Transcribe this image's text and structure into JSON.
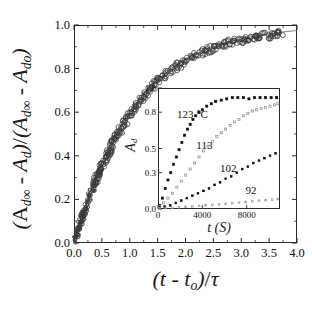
{
  "figure": {
    "background": "#ffffff",
    "ink": "#1a1a1a"
  },
  "chart_data": [
    {
      "id": "main",
      "type": "scatter",
      "title": "",
      "xlabel": "(t - to)/τ",
      "ylabel": "(Ad∞ - Ad)/(Ad∞ - Ado)",
      "xlim": [
        0.0,
        4.0
      ],
      "ylim": [
        0.0,
        1.0
      ],
      "xticks": [
        "0.0",
        "0.5",
        "1.0",
        "1.5",
        "2.0",
        "2.5",
        "3.0",
        "3.5",
        "4.0"
      ],
      "xtick_values": [
        0.0,
        0.5,
        1.0,
        1.5,
        2.0,
        2.5,
        3.0,
        3.5,
        4.0
      ],
      "yticks": [
        "0.0",
        "0.2",
        "0.4",
        "0.6",
        "0.8",
        "1.0"
      ],
      "ytick_values": [
        0.0,
        0.2,
        0.4,
        0.6,
        0.8,
        1.0
      ],
      "grid": false,
      "legend": "none",
      "marker": "open-circle",
      "marker_color": "#333333",
      "fit_line": {
        "present": true,
        "style": "solid-thin",
        "color": "#555555",
        "description": "master curve 1-exp(-x) style saturating fit"
      },
      "series": [
        {
          "name": "master curve (all temperatures collapsed)",
          "x": [
            0.02,
            0.04,
            0.05,
            0.06,
            0.07,
            0.08,
            0.09,
            0.1,
            0.11,
            0.12,
            0.13,
            0.14,
            0.15,
            0.16,
            0.17,
            0.18,
            0.19,
            0.2,
            0.22,
            0.24,
            0.26,
            0.28,
            0.3,
            0.32,
            0.34,
            0.36,
            0.38,
            0.4,
            0.42,
            0.44,
            0.46,
            0.48,
            0.5,
            0.53,
            0.56,
            0.59,
            0.62,
            0.65,
            0.68,
            0.71,
            0.74,
            0.77,
            0.8,
            0.84,
            0.88,
            0.92,
            0.96,
            1.0,
            1.05,
            1.1,
            1.15,
            1.2,
            1.25,
            1.3,
            1.36,
            1.42,
            1.48,
            1.54,
            1.6,
            1.67,
            1.74,
            1.81,
            1.88,
            1.95,
            2.02,
            2.1,
            2.18,
            2.26,
            2.34,
            2.42,
            2.5,
            2.58,
            2.66,
            2.74,
            2.82,
            2.9,
            2.98,
            3.06,
            3.14,
            3.22,
            3.3,
            3.38,
            3.46,
            3.54,
            3.62,
            3.7
          ],
          "y": [
            0.015,
            0.03,
            0.04,
            0.05,
            0.058,
            0.066,
            0.074,
            0.082,
            0.09,
            0.098,
            0.106,
            0.113,
            0.121,
            0.128,
            0.136,
            0.143,
            0.15,
            0.158,
            0.172,
            0.186,
            0.2,
            0.213,
            0.227,
            0.24,
            0.253,
            0.266,
            0.278,
            0.29,
            0.302,
            0.314,
            0.326,
            0.338,
            0.349,
            0.366,
            0.382,
            0.398,
            0.414,
            0.429,
            0.444,
            0.459,
            0.473,
            0.487,
            0.5,
            0.518,
            0.535,
            0.552,
            0.568,
            0.584,
            0.603,
            0.621,
            0.638,
            0.655,
            0.671,
            0.686,
            0.704,
            0.72,
            0.735,
            0.75,
            0.763,
            0.778,
            0.792,
            0.805,
            0.817,
            0.828,
            0.839,
            0.85,
            0.86,
            0.869,
            0.878,
            0.886,
            0.894,
            0.901,
            0.907,
            0.913,
            0.919,
            0.924,
            0.929,
            0.933,
            0.938,
            0.941,
            0.945,
            0.948,
            0.951,
            0.954,
            0.957,
            0.959
          ]
        }
      ],
      "scatter_note": "several hundred overlapping open circles from four temperature runs collapsed onto one master curve"
    },
    {
      "id": "inset",
      "type": "scatter",
      "title": "",
      "xlabel": "t (S)",
      "ylabel": "Ad",
      "xlim": [
        0,
        11000
      ],
      "ylim": [
        0.0,
        1.0
      ],
      "xticks": [
        "0",
        "4000",
        "8000"
      ],
      "xtick_values": [
        0,
        4000,
        8000
      ],
      "yticks": [
        "0.0",
        "0.3",
        "0.5",
        "0.8",
        "1.0"
      ],
      "ytick_values": [
        0.0,
        0.3,
        0.5,
        0.8,
        1.0
      ],
      "grid": false,
      "legend": "inline-annotations",
      "series": [
        {
          "name": "123 °C",
          "label": "123 °C",
          "marker": "filled-square",
          "color": "#111111",
          "x": [
            150,
            400,
            650,
            900,
            1150,
            1400,
            1650,
            1900,
            2150,
            2400,
            2650,
            2900,
            3150,
            3400,
            3700,
            4000,
            4400,
            4800,
            5200,
            5700,
            6200,
            6700,
            7200,
            7700,
            8200,
            8700,
            9200,
            9700,
            10200,
            10700
          ],
          "y": [
            0.03,
            0.09,
            0.17,
            0.24,
            0.3,
            0.37,
            0.43,
            0.49,
            0.55,
            0.61,
            0.66,
            0.7,
            0.74,
            0.77,
            0.8,
            0.82,
            0.85,
            0.87,
            0.89,
            0.9,
            0.91,
            0.92,
            0.92,
            0.92,
            0.91,
            0.92,
            0.92,
            0.92,
            0.92,
            0.92
          ]
        },
        {
          "name": "113",
          "label": "113",
          "marker": "open-square",
          "color": "#8a8a8a",
          "x": [
            150,
            500,
            900,
            1300,
            1700,
            2100,
            2500,
            2900,
            3300,
            3700,
            4100,
            4500,
            4900,
            5300,
            5700,
            6100,
            6500,
            6900,
            7300,
            7700,
            8100,
            8500,
            8900,
            9300,
            9700,
            10100,
            10500,
            10800
          ],
          "y": [
            0.02,
            0.05,
            0.09,
            0.13,
            0.18,
            0.23,
            0.28,
            0.33,
            0.38,
            0.43,
            0.48,
            0.52,
            0.56,
            0.6,
            0.63,
            0.66,
            0.69,
            0.72,
            0.74,
            0.77,
            0.79,
            0.81,
            0.82,
            0.83,
            0.84,
            0.85,
            0.86,
            0.87
          ]
        },
        {
          "name": "102",
          "label": "102",
          "marker": "filled-square-small",
          "color": "#111111",
          "x": [
            150,
            600,
            1100,
            1600,
            2100,
            2600,
            3100,
            3600,
            4100,
            4600,
            5100,
            5600,
            6100,
            6600,
            7100,
            7600,
            8100,
            8600,
            9100,
            9600,
            10100,
            10600
          ],
          "y": [
            0.01,
            0.02,
            0.03,
            0.05,
            0.07,
            0.09,
            0.11,
            0.13,
            0.15,
            0.17,
            0.2,
            0.22,
            0.25,
            0.27,
            0.3,
            0.33,
            0.35,
            0.38,
            0.4,
            0.42,
            0.44,
            0.46
          ]
        },
        {
          "name": "92",
          "label": "92",
          "marker": "open-square-small",
          "color": "#9a9a9a",
          "x": [
            150,
            700,
            1300,
            1900,
            2500,
            3100,
            3700,
            4300,
            4900,
            5500,
            6100,
            6700,
            7300,
            7900,
            8500,
            9100,
            9700,
            10300,
            10800
          ],
          "y": [
            0.005,
            0.008,
            0.011,
            0.014,
            0.018,
            0.022,
            0.026,
            0.03,
            0.034,
            0.038,
            0.043,
            0.048,
            0.053,
            0.058,
            0.063,
            0.068,
            0.073,
            0.078,
            0.083
          ]
        }
      ]
    }
  ],
  "main_axis": {
    "xticks": [
      "0.0",
      "0.5",
      "1.0",
      "1.5",
      "2.0",
      "2.5",
      "3.0",
      "3.5",
      "4.0"
    ],
    "yticks": [
      "0.0",
      "0.2",
      "0.4",
      "0.6",
      "0.8",
      "1.0"
    ]
  },
  "inset_axis": {
    "xticks": [
      "0",
      "4000",
      "8000"
    ],
    "yticks": [
      "0.0",
      "0.3",
      "0.5",
      "0.8",
      "1.0"
    ]
  },
  "labels": {
    "inset_series": [
      "123 °C",
      "113",
      "102",
      "92"
    ]
  }
}
